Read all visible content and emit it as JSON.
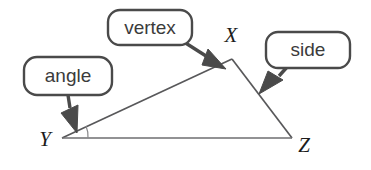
{
  "diagram": {
    "background_color": "#ffffff",
    "ink_color": "#4a4a4a",
    "edge_color": "#58585a",
    "label_color": "#1c1c1c",
    "callouts": [
      {
        "id": "vertex",
        "label": "vertex",
        "points_to": "vertex-x"
      },
      {
        "id": "side",
        "label": "side",
        "points_to": "side-xz"
      },
      {
        "id": "angle",
        "label": "angle",
        "points_to": "angle-y"
      }
    ],
    "vertices": [
      {
        "id": "x",
        "label": "X",
        "x": 232,
        "y": 59
      },
      {
        "id": "y",
        "label": "Y",
        "x": 62,
        "y": 138
      },
      {
        "id": "z",
        "label": "Z",
        "x": 292,
        "y": 138
      }
    ]
  }
}
